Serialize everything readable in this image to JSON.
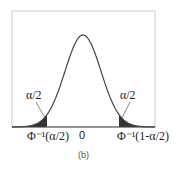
{
  "figure": {
    "caption": "(b)",
    "labels": {
      "left_tail_area": "α/2",
      "right_tail_area": "α/2",
      "left_critical": "Φ⁻¹(α/2)",
      "center": "0",
      "right_critical": "Φ⁻¹(1-α/2)"
    },
    "colors": {
      "curve": "#444444",
      "shade": "#333333",
      "frame": "#cccccc"
    }
  }
}
